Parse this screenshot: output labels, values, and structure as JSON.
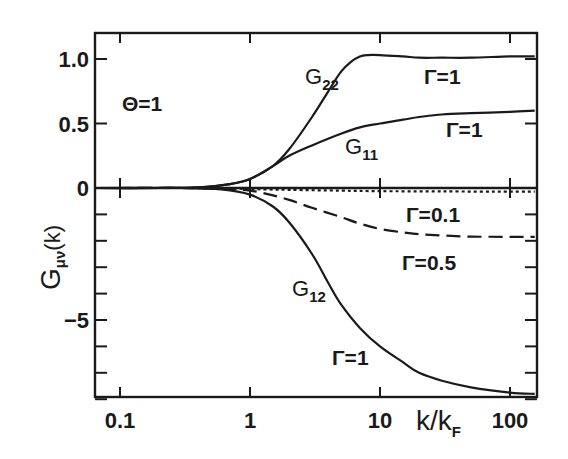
{
  "chart_data": {
    "type": "line",
    "title": "",
    "xlabel": "k/k_F",
    "ylabel": "G_{μν}(k)",
    "xscale": "log",
    "xlim": [
      0.065,
      155
    ],
    "ylim": [
      -8.2,
      1.2
    ],
    "y_axis_note": "piecewise linear: positive region (0 to 1.2) expanded ~5x relative to negative region",
    "x_ticks": [
      0.1,
      1,
      10,
      100
    ],
    "x_tick_labels": [
      "0.1",
      "1",
      "10",
      "100"
    ],
    "y_ticks_labeled": [
      1.0,
      0.5,
      0,
      -5
    ],
    "y_tick_labels": [
      "1.0",
      "0.5",
      "0",
      "−5"
    ],
    "y_minor_ticks": [
      -1,
      -2,
      -3,
      -4,
      -6,
      -7,
      -8
    ],
    "grid": false,
    "legend": null,
    "annotations": [
      "Θ=1",
      "G22",
      "G11",
      "G12",
      "Γ=1",
      "Γ=1",
      "Γ=0.1",
      "Γ=0.5",
      "Γ=1"
    ],
    "series": [
      {
        "name": "G22 (Γ=1)",
        "style": "solid",
        "x": [
          0.065,
          0.2,
          0.4,
          0.7,
          1,
          1.5,
          2,
          3,
          4,
          5,
          6,
          7,
          8,
          10,
          15,
          20,
          30,
          50,
          100,
          155
        ],
        "y": [
          0,
          0,
          0.005,
          0.03,
          0.07,
          0.17,
          0.3,
          0.55,
          0.75,
          0.9,
          0.98,
          1.02,
          1.03,
          1.03,
          1.02,
          1.01,
          1.01,
          1.01,
          1.02,
          1.02
        ]
      },
      {
        "name": "G11 (Γ=1)",
        "style": "solid",
        "x": [
          0.065,
          0.2,
          0.4,
          0.7,
          1,
          1.5,
          2,
          3,
          5,
          7,
          10,
          15,
          20,
          30,
          50,
          100,
          155
        ],
        "y": [
          0,
          0,
          0.005,
          0.03,
          0.07,
          0.17,
          0.25,
          0.33,
          0.42,
          0.47,
          0.5,
          0.53,
          0.55,
          0.57,
          0.58,
          0.59,
          0.6
        ]
      },
      {
        "name": "G12 (Γ=0.1)",
        "style": "dotted",
        "x": [
          0.065,
          0.3,
          0.6,
          1,
          2,
          5,
          10,
          30,
          100,
          155
        ],
        "y": [
          0,
          0,
          -0.01,
          -0.04,
          -0.07,
          -0.1,
          -0.12,
          -0.13,
          -0.14,
          -0.14
        ]
      },
      {
        "name": "G12 (Γ=0.5)",
        "style": "dashed",
        "x": [
          0.065,
          0.3,
          0.6,
          1,
          1.5,
          2,
          3,
          5,
          7,
          10,
          15,
          20,
          30,
          50,
          100,
          155
        ],
        "y": [
          0,
          0,
          -0.03,
          -0.1,
          -0.28,
          -0.45,
          -0.75,
          -1.1,
          -1.35,
          -1.55,
          -1.68,
          -1.75,
          -1.8,
          -1.84,
          -1.85,
          -1.85
        ]
      },
      {
        "name": "G12 (Γ=1)",
        "style": "solid",
        "x": [
          0.065,
          0.3,
          0.6,
          1,
          1.5,
          2,
          3,
          4,
          5,
          7,
          10,
          15,
          20,
          30,
          50,
          100,
          155
        ],
        "y": [
          0,
          0,
          -0.05,
          -0.25,
          -0.7,
          -1.3,
          -2.5,
          -3.6,
          -4.4,
          -5.3,
          -6.0,
          -6.6,
          -7.0,
          -7.3,
          -7.55,
          -7.75,
          -7.8
        ]
      }
    ]
  },
  "labels": {
    "theta": "Θ=1",
    "g22": "G",
    "g22_sub": "22",
    "g11": "G",
    "g11_sub": "11",
    "g12": "G",
    "g12_sub": "12",
    "gamma_g22": "Γ=1",
    "gamma_g11": "Γ=1",
    "gamma_01": "Γ=0.1",
    "gamma_05": "Γ=0.5",
    "gamma_g12": "Γ=1",
    "ylabel_main": "G",
    "ylabel_sub": "μν",
    "ylabel_tail": "(k)",
    "xlabel_main": "k/k",
    "xlabel_sub": "F"
  },
  "colors": {
    "ink": "#1a1a1a",
    "background": "#ffffff"
  }
}
